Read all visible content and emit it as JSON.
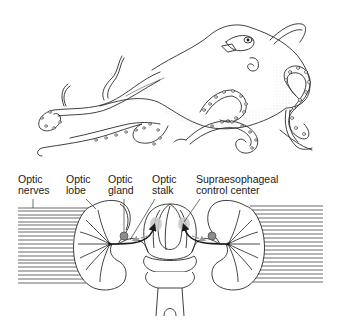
{
  "figure": {
    "top_illustration": "octopus",
    "bottom_illustration": "octopus-brain-optic-system"
  },
  "labels": [
    {
      "id": "optic-nerves",
      "line1": "Optic",
      "line2": "nerves",
      "x": 18,
      "y": 175
    },
    {
      "id": "optic-lobe",
      "line1": "Optic",
      "line2": "lobe",
      "x": 66,
      "y": 175
    },
    {
      "id": "optic-gland",
      "line1": "Optic",
      "line2": "gland",
      "x": 108,
      "y": 175
    },
    {
      "id": "optic-stalk",
      "line1": "Optic",
      "line2": "stalk",
      "x": 152,
      "y": 175
    },
    {
      "id": "supraesophageal-control-center",
      "line1": "Supraesophageal",
      "line2": "control center",
      "x": 196,
      "y": 175
    }
  ],
  "colors": {
    "ink": "#1a1a1a",
    "gland": "#8c8c8c",
    "control_center": "#c8c8c8",
    "arrow_gray": "#9a9a9a",
    "stipple": "#bdbdbd"
  }
}
